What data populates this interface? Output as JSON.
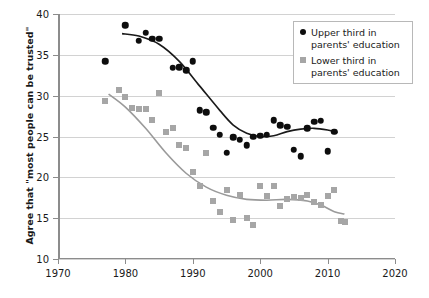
{
  "chart_data": {
    "type": "scatter",
    "title": "",
    "xlabel": "",
    "ylabel": "Agree that \"most people can be trusted\"",
    "xlim": [
      1970,
      2020
    ],
    "ylim": [
      10,
      40
    ],
    "xticks": [
      1970,
      1980,
      1990,
      2000,
      2010,
      2020
    ],
    "yticks": [
      10,
      15,
      20,
      25,
      30,
      35,
      40
    ],
    "grid": true,
    "legend_position": "top-right",
    "series": [
      {
        "name": "Upper third in parents' education",
        "marker": "circle",
        "color": "#0d0d0d",
        "points": [
          [
            1977,
            34.2
          ],
          [
            1980,
            38.6
          ],
          [
            1982,
            36.7
          ],
          [
            1983,
            37.7
          ],
          [
            1984,
            37.0
          ],
          [
            1985,
            37.0
          ],
          [
            1987,
            33.4
          ],
          [
            1988,
            33.5
          ],
          [
            1989,
            33.1
          ],
          [
            1990,
            34.2
          ],
          [
            1991,
            28.2
          ],
          [
            1992,
            28.0
          ],
          [
            1993,
            26.1
          ],
          [
            1994,
            25.2
          ],
          [
            1995,
            23.0
          ],
          [
            1996,
            24.9
          ],
          [
            1997,
            24.6
          ],
          [
            1998,
            23.9
          ],
          [
            1999,
            25.0
          ],
          [
            2000,
            25.1
          ],
          [
            2001,
            25.2
          ],
          [
            2002,
            27.0
          ],
          [
            2003,
            26.4
          ],
          [
            2004,
            26.2
          ],
          [
            2005,
            23.4
          ],
          [
            2006,
            22.6
          ],
          [
            2007,
            26.0
          ],
          [
            2008,
            26.8
          ],
          [
            2009,
            26.9
          ],
          [
            2010,
            23.2
          ],
          [
            2011,
            25.6
          ]
        ],
        "trend": [
          [
            1979.5,
            37.6
          ],
          [
            1982,
            37.3
          ],
          [
            1985,
            36.3
          ],
          [
            1988,
            34.2
          ],
          [
            1991,
            31.2
          ],
          [
            1994,
            28.2
          ],
          [
            1996,
            26.4
          ],
          [
            1998,
            25.4
          ],
          [
            2000,
            25.0
          ],
          [
            2002,
            25.1
          ],
          [
            2004,
            25.6
          ],
          [
            2006,
            25.9
          ],
          [
            2008,
            26.0
          ],
          [
            2010,
            25.8
          ],
          [
            2011.5,
            25.5
          ]
        ]
      },
      {
        "name": "Lower third in parents' education",
        "marker": "square",
        "color": "#a6a6a6",
        "points": [
          [
            1977,
            29.3
          ],
          [
            1979,
            30.7
          ],
          [
            1980,
            29.8
          ],
          [
            1981,
            28.5
          ],
          [
            1982,
            28.4
          ],
          [
            1983,
            28.4
          ],
          [
            1984,
            27.0
          ],
          [
            1985,
            30.3
          ],
          [
            1986,
            25.5
          ],
          [
            1987,
            26.0
          ],
          [
            1988,
            24.0
          ],
          [
            1989,
            23.6
          ],
          [
            1990,
            20.6
          ],
          [
            1991,
            18.9
          ],
          [
            1992,
            23.0
          ],
          [
            1993,
            17.1
          ],
          [
            1994,
            15.8
          ],
          [
            1995,
            18.4
          ],
          [
            1996,
            14.8
          ],
          [
            1997,
            17.8
          ],
          [
            1998,
            15.0
          ],
          [
            1999,
            14.2
          ],
          [
            2000,
            19.0
          ],
          [
            2001,
            17.7
          ],
          [
            2002,
            19.0
          ],
          [
            2003,
            16.5
          ],
          [
            2004,
            17.4
          ],
          [
            2005,
            17.6
          ],
          [
            2006,
            17.5
          ],
          [
            2007,
            17.8
          ],
          [
            2008,
            17.0
          ],
          [
            2009,
            16.6
          ],
          [
            2010,
            17.7
          ],
          [
            2011,
            18.4
          ],
          [
            2012,
            14.7
          ],
          [
            2012.6,
            14.5
          ]
        ],
        "trend": [
          [
            1977.5,
            30.2
          ],
          [
            1980,
            28.6
          ],
          [
            1983,
            26.0
          ],
          [
            1986,
            23.0
          ],
          [
            1989,
            20.5
          ],
          [
            1992,
            18.8
          ],
          [
            1995,
            17.8
          ],
          [
            1998,
            17.3
          ],
          [
            2001,
            17.2
          ],
          [
            2004,
            17.3
          ],
          [
            2007,
            17.1
          ],
          [
            2009,
            16.6
          ],
          [
            2011,
            15.8
          ],
          [
            2012.5,
            15.5
          ]
        ]
      }
    ]
  },
  "legend": {
    "items": [
      {
        "label_line1": "Upper third in",
        "label_line2": "parents' education"
      },
      {
        "label_line1": "Lower third in",
        "label_line2": "parents' education"
      }
    ]
  }
}
